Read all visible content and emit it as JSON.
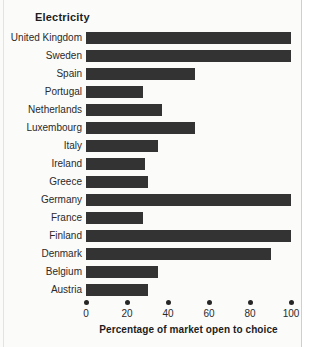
{
  "chart_data": {
    "type": "bar",
    "orientation": "horizontal",
    "title": "Electricity",
    "xlabel": "Percentage of market open to choice",
    "ylabel": "",
    "xlim": [
      0,
      100
    ],
    "xticks": [
      0,
      20,
      40,
      60,
      80,
      100
    ],
    "xtick_labels": [
      "0",
      "20",
      "40",
      "60",
      "80",
      "100"
    ],
    "grid": false,
    "legend": null,
    "bar_color": "#333333",
    "background_color": "#fbfbfa",
    "categories": [
      "United Kingdom",
      "Sweden",
      "Spain",
      "Portugal",
      "Netherlands",
      "Luxembourg",
      "Italy",
      "Ireland",
      "Greece",
      "Germany",
      "France",
      "Finland",
      "Denmark",
      "Belgium",
      "Austria"
    ],
    "values": [
      100,
      100,
      53,
      28,
      37,
      53,
      35,
      29,
      30,
      100,
      28,
      100,
      90,
      35,
      30
    ]
  }
}
